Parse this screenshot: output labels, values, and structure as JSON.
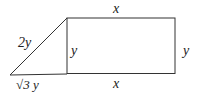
{
  "diagram": {
    "labels": {
      "rect_top": "x",
      "rect_bottom": "x",
      "rect_right": "y",
      "shared_side": "y",
      "hypotenuse": "2y",
      "triangle_base": "√3 y"
    },
    "colors": {
      "stroke": "#333333",
      "text": "#222222"
    }
  }
}
